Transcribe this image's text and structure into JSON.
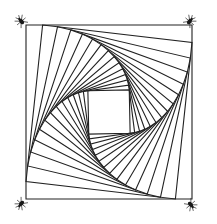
{
  "figure": {
    "width": 217,
    "height": 224,
    "stroke_color": "#222222",
    "background": "#ffffff",
    "outer_square": {
      "corners": [
        [
          26,
          25
        ],
        [
          192,
          25
        ],
        [
          192,
          199
        ],
        [
          26,
          199
        ]
      ]
    },
    "whirl": {
      "steps": 14,
      "fraction_along_edge": 0.1,
      "direction": "clockwise-vertex-advance"
    },
    "bugs": [
      {
        "name": "bug-top-left",
        "x": 21,
        "y": 21,
        "angle": -40
      },
      {
        "name": "bug-top-right",
        "x": 190,
        "y": 21,
        "angle": 40
      },
      {
        "name": "bug-bottom-left",
        "x": 21,
        "y": 204,
        "angle": 220
      },
      {
        "name": "bug-bottom-right",
        "x": 191,
        "y": 205,
        "angle": 140
      }
    ]
  }
}
